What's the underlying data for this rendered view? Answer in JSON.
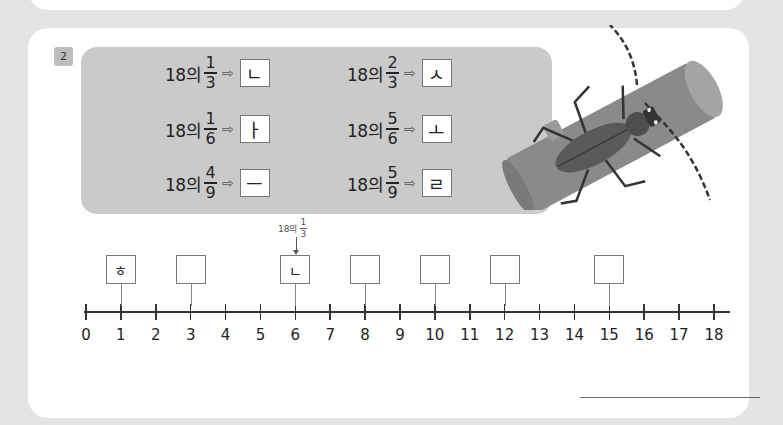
{
  "problem": {
    "number": "2",
    "whole": "18",
    "particle": "의",
    "arrow_glyph": "⇨",
    "pairs": [
      {
        "num": "1",
        "den": "3",
        "letter": "ㄴ"
      },
      {
        "num": "1",
        "den": "6",
        "letter": "ㅏ"
      },
      {
        "num": "4",
        "den": "9",
        "letter": "ㅡ"
      },
      {
        "num": "2",
        "den": "3",
        "letter": "ㅅ"
      },
      {
        "num": "5",
        "den": "6",
        "letter": "ㅗ"
      },
      {
        "num": "5",
        "den": "9",
        "letter": "ㄹ"
      }
    ]
  },
  "number_line": {
    "min": 0,
    "max": 18,
    "labels": [
      "0",
      "1",
      "2",
      "3",
      "4",
      "5",
      "6",
      "7",
      "8",
      "9",
      "10",
      "11",
      "12",
      "13",
      "14",
      "15",
      "16",
      "17",
      "18"
    ],
    "boxes": [
      {
        "at": 1,
        "value": "ㅎ"
      },
      {
        "at": 3,
        "value": ""
      },
      {
        "at": 6,
        "value": "ㄴ"
      },
      {
        "at": 8,
        "value": ""
      },
      {
        "at": 10,
        "value": ""
      },
      {
        "at": 12,
        "value": ""
      },
      {
        "at": 15,
        "value": ""
      }
    ],
    "callout": {
      "whole": "18",
      "particle": "의",
      "num": "1",
      "den": "3",
      "at": 6
    }
  },
  "illustration": {
    "icon": "beetle-on-log-icon"
  },
  "answer": {
    "value": ""
  }
}
